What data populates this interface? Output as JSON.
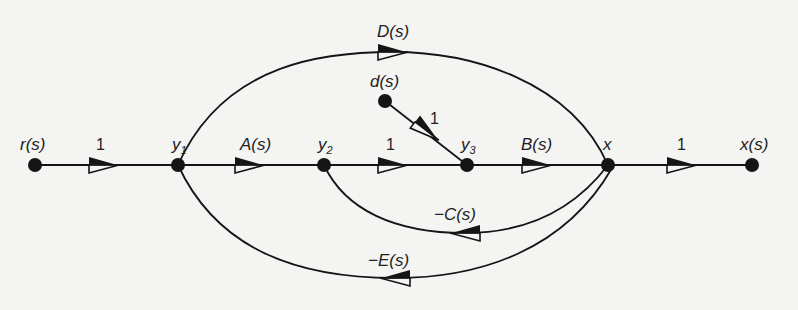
{
  "diagram": {
    "type": "signal-flow-graph",
    "nodes": [
      {
        "id": "r",
        "label": "r(s)",
        "x": 35,
        "y": 165
      },
      {
        "id": "y1",
        "label": "y",
        "sub": "1",
        "x": 178,
        "y": 165
      },
      {
        "id": "y2",
        "label": "y",
        "sub": "2",
        "x": 324,
        "y": 165
      },
      {
        "id": "y3",
        "label": "y",
        "sub": "3",
        "x": 467,
        "y": 165
      },
      {
        "id": "x",
        "label": "x",
        "x": 608,
        "y": 165
      },
      {
        "id": "xs",
        "label": "x(s)",
        "x": 752,
        "y": 165
      },
      {
        "id": "d",
        "label": "d(s)",
        "x": 385,
        "y": 101
      }
    ],
    "edges": [
      {
        "from": "r",
        "to": "y1",
        "gain": "1"
      },
      {
        "from": "y1",
        "to": "y2",
        "gain": "A(s)"
      },
      {
        "from": "y2",
        "to": "y3",
        "gain": "1"
      },
      {
        "from": "y3",
        "to": "x",
        "gain": "B(s)"
      },
      {
        "from": "x",
        "to": "xs",
        "gain": "1"
      },
      {
        "from": "d",
        "to": "y3",
        "gain": "1"
      },
      {
        "from": "y1",
        "to": "x",
        "gain": "D(s)"
      },
      {
        "from": "x",
        "to": "y2",
        "gain": "-C(s)"
      },
      {
        "from": "x",
        "to": "y1",
        "gain": "-E(s)"
      }
    ]
  },
  "labels": {
    "r": "r(s)",
    "y": "y",
    "y1_sub": "1",
    "y2_sub": "2",
    "y3_sub": "3",
    "x": "x",
    "xs": "x(s)",
    "d": "d(s)",
    "g_r_y1": "1",
    "g_y1_y2": "A(s)",
    "g_y2_y3": "1",
    "g_y3_x": "B(s)",
    "g_x_xs": "1",
    "g_d_y3": "1",
    "g_D": "D(s)",
    "g_C": "−C(s)",
    "g_E": "−E(s)"
  }
}
